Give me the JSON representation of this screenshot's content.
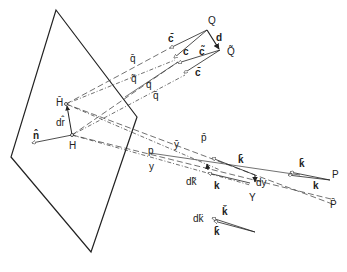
{
  "figure": {
    "type": "vector geometry diagram",
    "plane": {
      "vertices": [
        [
          56,
          10
        ],
        [
          137,
          117
        ],
        [
          91,
          252
        ],
        [
          11,
          157
        ]
      ]
    },
    "labels": {
      "Q": "Q",
      "Q_tilde": "Q̃",
      "d": "d",
      "c_bar": "c̄",
      "c": "c",
      "c_tilde": "c̃",
      "c_bar2": "c̄",
      "q_bar": "q̄",
      "q_tilde": "q̃",
      "q": "q",
      "q_bar2": "q̄",
      "H_bar": "H̄",
      "dr": "dr̂",
      "n": "n̂",
      "H": "H",
      "p_bar": "p̄",
      "y_bar": "ȳ",
      "p": "p",
      "y": "y",
      "k_bar_top": "k̄",
      "k_bar_right": "k̄",
      "P": "P",
      "k_right": "k",
      "dk_tilde": "dk̃",
      "k_left": "k",
      "dy": "dy",
      "Y": "Y",
      "P_prime": "P̄",
      "dk_double": "dk̈",
      "k_check": "ǩ",
      "k_bar_bottom": "k̄"
    }
  }
}
